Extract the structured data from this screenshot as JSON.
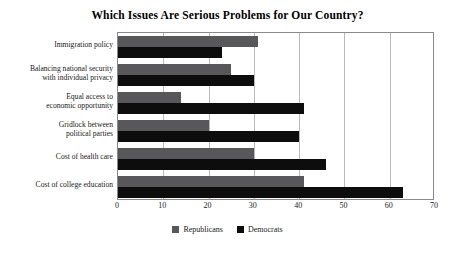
{
  "chart_data": {
    "type": "bar",
    "orientation": "horizontal",
    "title": "Which Issues Are Serious Problems for Our Country?",
    "xlabel": "",
    "ylabel": "",
    "xlim": [
      0,
      70
    ],
    "xticks": [
      0,
      10,
      20,
      30,
      40,
      50,
      60,
      70
    ],
    "grid": true,
    "legend_position": "bottom-center",
    "categories": [
      "Immigration policy",
      "Balancing national security with individual privacy",
      "Equal access to economic opportunity",
      "Gridlock between political parties",
      "Cost of health care",
      "Cost of college education"
    ],
    "category_lines": [
      [
        "Immigration policy"
      ],
      [
        "Balancing national security",
        "with individual privacy"
      ],
      [
        "Equal access to",
        "economic opportunity"
      ],
      [
        "Gridlock between",
        "political parties"
      ],
      [
        "Cost of health care"
      ],
      [
        "Cost of college education"
      ]
    ],
    "series": [
      {
        "name": "Republicans",
        "color": "#58585a",
        "values": [
          31,
          25,
          14,
          20,
          30,
          41
        ]
      },
      {
        "name": "Democrats",
        "color": "#0d0d0d",
        "values": [
          23,
          30,
          41,
          40,
          46,
          63
        ]
      }
    ]
  },
  "legend": {
    "items": [
      {
        "label": "Republicans",
        "color": "#58585a"
      },
      {
        "label": "Democrats",
        "color": "#0d0d0d"
      }
    ]
  },
  "colors": {
    "republican": "#58585a",
    "democrat": "#0d0d0d",
    "frame": "#8a8a8a",
    "gridline": "#b9b9b9",
    "background": "#ffffff"
  }
}
